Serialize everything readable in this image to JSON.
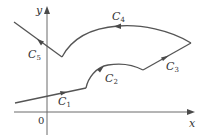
{
  "diagram": {
    "type": "piecewise-smooth oriented curve",
    "axes": {
      "x_label": "x",
      "y_label": "y",
      "origin_label": "0"
    },
    "curves": [
      {
        "id": "C1",
        "letter": "C",
        "subscript": "1",
        "shape": "line segment",
        "direction": "right"
      },
      {
        "id": "C2",
        "letter": "C",
        "subscript": "2",
        "shape": "arc bump",
        "direction": "right"
      },
      {
        "id": "C3",
        "letter": "C",
        "subscript": "3",
        "shape": "line segment",
        "direction": "up-right"
      },
      {
        "id": "C4",
        "letter": "C",
        "subscript": "4",
        "shape": "arc",
        "direction": "left"
      },
      {
        "id": "C5",
        "letter": "C",
        "subscript": "5",
        "shape": "line segment",
        "direction": "up-left"
      }
    ],
    "colors": {
      "curve": "#555555",
      "axis": "#6a6a6a",
      "text": "#333333"
    }
  }
}
